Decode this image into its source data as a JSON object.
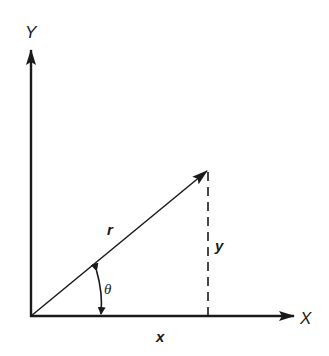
{
  "diagram": {
    "type": "polar-cartesian-coordinates",
    "axes": {
      "y_label": "Y",
      "x_label": "X"
    },
    "vector": {
      "label": "r",
      "from": [
        31,
        316
      ],
      "to": [
        208,
        170
      ]
    },
    "components": {
      "horizontal_label": "x",
      "vertical_label": "y",
      "vertical_style": "dashed"
    },
    "angle": {
      "label": "θ"
    },
    "colors": {
      "ink": "#1a1a1a",
      "background": "#ffffff"
    }
  }
}
